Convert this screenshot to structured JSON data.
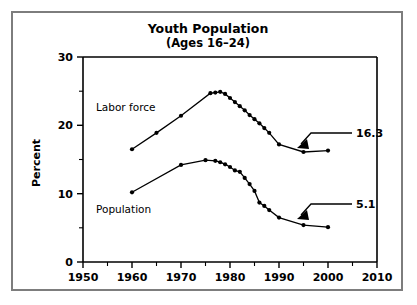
{
  "figure": {
    "title": "Youth Population",
    "subtitle": "(Ages 16–24)",
    "background_color": "#ffffff",
    "border_color": "#7d7d7d",
    "line_color": "#000000"
  },
  "axes": {
    "y_label": "Percent",
    "y_ticks": [
      "0",
      "10",
      "20",
      "30"
    ],
    "x_ticks": [
      "1950",
      "1960",
      "1970",
      "1980",
      "1990",
      "2000",
      "2010"
    ]
  },
  "series_labels": {
    "labor_force": "Labor force",
    "population": "Population"
  },
  "annotations": {
    "labor_force_end": "16.3",
    "population_end": "5.1"
  },
  "chart_data": {
    "type": "line",
    "title": "Youth Population (Ages 16–24)",
    "xlabel": "",
    "ylabel": "Percent",
    "xlim": [
      1950,
      2010
    ],
    "ylim": [
      0,
      30
    ],
    "x_major_ticks": [
      1950,
      1960,
      1970,
      1980,
      1990,
      2000,
      2010
    ],
    "x_minor_ticks": [
      1955,
      1965,
      1975,
      1985,
      1995,
      2005
    ],
    "y_major_ticks": [
      0,
      10,
      20,
      30
    ],
    "y_minor_ticks": [
      5,
      15,
      25
    ],
    "grid": false,
    "legend": "inline labels",
    "markers": "filled circles",
    "series": [
      {
        "name": "Labor force",
        "label_position": {
          "x": 1963,
          "y": 22.2
        },
        "end_annotation": "16.3",
        "points": [
          {
            "x": 1960,
            "y": 16.5
          },
          {
            "x": 1965,
            "y": 18.9
          },
          {
            "x": 1970,
            "y": 21.4
          },
          {
            "x": 1976,
            "y": 24.7
          },
          {
            "x": 1977,
            "y": 24.8
          },
          {
            "x": 1978,
            "y": 24.9
          },
          {
            "x": 1979,
            "y": 24.6
          },
          {
            "x": 1980,
            "y": 24.0
          },
          {
            "x": 1981,
            "y": 23.4
          },
          {
            "x": 1982,
            "y": 22.8
          },
          {
            "x": 1983,
            "y": 22.2
          },
          {
            "x": 1984,
            "y": 21.5
          },
          {
            "x": 1985,
            "y": 20.9
          },
          {
            "x": 1986,
            "y": 20.3
          },
          {
            "x": 1987,
            "y": 19.6
          },
          {
            "x": 1988,
            "y": 18.9
          },
          {
            "x": 1990,
            "y": 17.2
          },
          {
            "x": 1995,
            "y": 16.1
          },
          {
            "x": 2000,
            "y": 16.3
          }
        ]
      },
      {
        "name": "Population",
        "label_position": {
          "x": 1963,
          "y": 8.3
        },
        "end_annotation": "5.1",
        "points": [
          {
            "x": 1960,
            "y": 10.2
          },
          {
            "x": 1970,
            "y": 14.2
          },
          {
            "x": 1975,
            "y": 14.9
          },
          {
            "x": 1977,
            "y": 14.8
          },
          {
            "x": 1978,
            "y": 14.6
          },
          {
            "x": 1979,
            "y": 14.3
          },
          {
            "x": 1980,
            "y": 13.9
          },
          {
            "x": 1981,
            "y": 13.4
          },
          {
            "x": 1982,
            "y": 13.2
          },
          {
            "x": 1983,
            "y": 12.3
          },
          {
            "x": 1984,
            "y": 11.4
          },
          {
            "x": 1985,
            "y": 10.4
          },
          {
            "x": 1986,
            "y": 8.7
          },
          {
            "x": 1987,
            "y": 8.2
          },
          {
            "x": 1988,
            "y": 7.6
          },
          {
            "x": 1990,
            "y": 6.5
          },
          {
            "x": 1995,
            "y": 5.4
          },
          {
            "x": 2000,
            "y": 5.1
          }
        ]
      }
    ]
  }
}
